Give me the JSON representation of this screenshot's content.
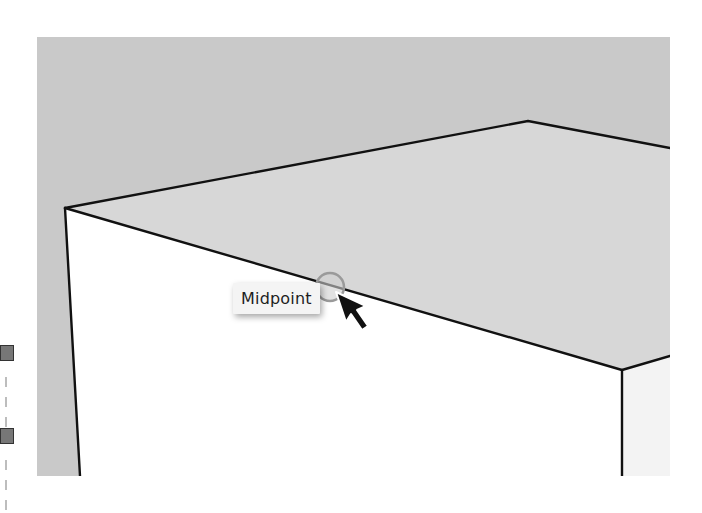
{
  "canvas": {
    "background": "#c9c9c9",
    "top_face_color": "#d6d6d6",
    "front_face_color": "#ffffff",
    "side_face_color": "#f2f2f2",
    "edge_color": "#111111"
  },
  "inference": {
    "tooltip_label": "Midpoint",
    "snap_circle_color": "#9a9a9a",
    "icon": "midpoint-snap-circle"
  },
  "cursor": {
    "icon": "arrow-pointer-icon"
  },
  "side_markers": [
    {
      "icon": "section-marker-icon",
      "color": "#777777"
    },
    {
      "icon": "section-marker-icon",
      "color": "#777777"
    }
  ]
}
